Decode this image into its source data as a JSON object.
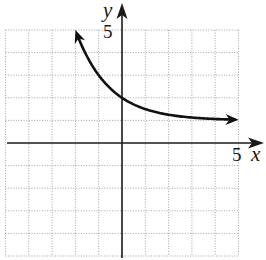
{
  "chart_data": {
    "type": "line",
    "title": "",
    "xlabel": "x",
    "ylabel": "y",
    "xlim": [
      -5,
      5
    ],
    "ylim": [
      -5,
      5
    ],
    "grid": true,
    "grid_step": 1,
    "tick_labels": {
      "x": [
        "5"
      ],
      "y": [
        "5"
      ]
    },
    "series": [
      {
        "name": "exponential curve",
        "equation_form": "y = 2^(-x) + 1",
        "horizontal_asymptote": 1,
        "arrows": "both ends",
        "x": [
          -2.0,
          -1.5,
          -1.0,
          -0.5,
          0,
          0.5,
          1,
          1.5,
          2,
          3,
          4,
          5
        ],
        "values": [
          5.0,
          3.83,
          3.0,
          2.41,
          2.0,
          1.71,
          1.5,
          1.35,
          1.25,
          1.13,
          1.06,
          1.03
        ]
      }
    ]
  },
  "labels": {
    "x_axis": "x",
    "y_axis": "y",
    "x_tick": "5",
    "y_tick": "5"
  }
}
